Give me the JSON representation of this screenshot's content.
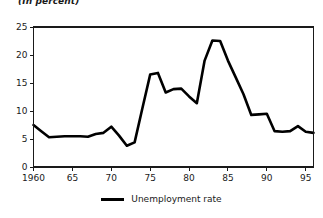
{
  "chart_data": {
    "type": "line",
    "title": "(In percent)",
    "xlabel": "",
    "ylabel": "",
    "xlim": [
      1960,
      1996
    ],
    "ylim": [
      0,
      25
    ],
    "grid": false,
    "legend_position": "bottom-center",
    "y_ticks": [
      0,
      5,
      10,
      15,
      20,
      25
    ],
    "y_tick_labels": [
      "0",
      "5",
      "10",
      "15",
      "20",
      "25"
    ],
    "x_ticks": [
      1960,
      1965,
      1970,
      1975,
      1980,
      1985,
      1990,
      1995
    ],
    "x_tick_labels": [
      "1960",
      "65",
      "70",
      "75",
      "80",
      "85",
      "90",
      "95"
    ],
    "series": [
      {
        "name": "Unemployment rate",
        "color": "#000000",
        "x": [
          1960,
          1961,
          1962,
          1963,
          1964,
          1965,
          1966,
          1967,
          1968,
          1969,
          1970,
          1971,
          1972,
          1973,
          1974,
          1975,
          1976,
          1977,
          1978,
          1979,
          1980,
          1981,
          1982,
          1983,
          1984,
          1985,
          1986,
          1987,
          1988,
          1989,
          1990,
          1991,
          1992,
          1993,
          1994,
          1995,
          1996
        ],
        "values": [
          7.5,
          6.4,
          5.3,
          5.4,
          5.5,
          5.5,
          5.5,
          5.4,
          5.9,
          6.1,
          7.2,
          5.6,
          3.8,
          4.4,
          10.5,
          16.5,
          16.8,
          13.3,
          13.9,
          14.0,
          12.6,
          11.4,
          19.0,
          22.6,
          22.5,
          19.0,
          16.0,
          13.0,
          9.3,
          9.4,
          9.5,
          6.4,
          6.3,
          6.4,
          7.3,
          6.3,
          6.1
        ]
      }
    ]
  },
  "legend": {
    "series_label": "Unemployment rate"
  }
}
